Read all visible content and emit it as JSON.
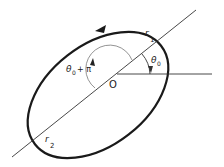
{
  "diagram": {
    "labels": {
      "origin": "O",
      "r1": "r",
      "r1_sub": "1",
      "r2": "r",
      "r2_sub": "2",
      "theta0": "θ",
      "theta0_sub": "0",
      "theta0_pi": "θ",
      "theta0_pi_sub": "0",
      "theta0_pi_suffix": "+ π"
    },
    "colors": {
      "ellipse": "#1a1a1a",
      "lines": "#333333",
      "arc": "#555555",
      "background": "#ffffff"
    }
  }
}
